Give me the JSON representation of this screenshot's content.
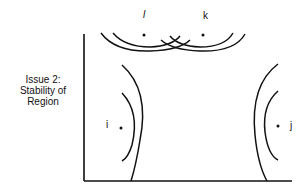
{
  "diagram": {
    "axis_label": {
      "lines": [
        "Issue 2:",
        "Stability of",
        "Region"
      ]
    },
    "points": [
      {
        "id": "l",
        "label": "l",
        "italic": true
      },
      {
        "id": "k",
        "label": "k",
        "italic": false
      },
      {
        "id": "i",
        "label": "i",
        "italic": false
      },
      {
        "id": "j",
        "label": "j",
        "italic": false
      }
    ],
    "colors": {
      "stroke": "#111111",
      "background": "#ffffff"
    }
  }
}
